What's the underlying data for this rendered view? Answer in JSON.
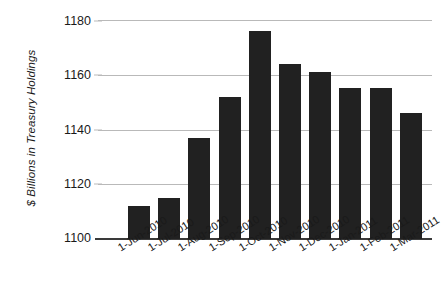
{
  "chart_data": {
    "type": "bar",
    "title": "",
    "xlabel": "",
    "ylabel": "$ Billions in Treasury Holdings",
    "ylim": [
      1100,
      1180
    ],
    "yticks": [
      1100,
      1120,
      1140,
      1160,
      1180
    ],
    "grid": true,
    "legend": null,
    "bar_color": "#212121",
    "categories": [
      "1-Jun-2010",
      "1-Jul-2010",
      "1-Aug-2010",
      "1-Sep-2010",
      "1-Oct-2010",
      "1-Nov-2010",
      "1-Dec-2010",
      "1-Jan-2011",
      "1-Feb-2011",
      "1-Mar-2011"
    ],
    "values": [
      1112,
      1115,
      1137,
      1152,
      1176,
      1164,
      1161,
      1155,
      1155,
      1146
    ]
  },
  "axes": {
    "y_title": "$ Billions in Treasury Holdings",
    "y_tick_labels": [
      "1180",
      "1160",
      "1140",
      "1120",
      "1100"
    ],
    "x_tick_labels": [
      "1-Jun-2010",
      "1-Jul-2010",
      "1-Aug-2010",
      "1-Sep-2010",
      "1-Oct-2010",
      "1-Nov-2010",
      "1-Dec-2010",
      "1-Jan-2011",
      "1-Feb-2011",
      "1-Mar-2011"
    ]
  }
}
